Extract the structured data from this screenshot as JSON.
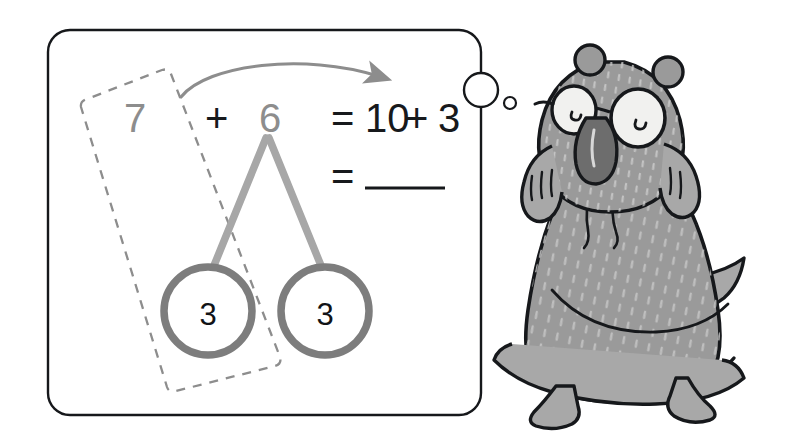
{
  "page": {
    "width": 795,
    "height": 436,
    "background": "#ffffff",
    "kind": "math-worksheet-illustration"
  },
  "panel": {
    "label": "make-ten-strategy-panel",
    "border_color": "#16181b",
    "fill": "#ffffff",
    "x": 48,
    "y": 30,
    "width": 433,
    "height": 385,
    "radius": 22
  },
  "equation": {
    "addend_left": "7",
    "plus": "+",
    "addend_right": "6",
    "equals_first": "=",
    "ten": "10",
    "plus_second": "+",
    "three": "3",
    "equals_second": "=",
    "blank_answer": "",
    "dim_color": "#8d8d8d",
    "dark_color": "#17191c"
  },
  "number_bond": {
    "label": "decomposition-of-6",
    "branch_color": "#a7a7a7",
    "circle_stroke": "#7d7d7d",
    "left_part": "3",
    "right_part": "3"
  },
  "dashed_box": {
    "label": "make-ten-grouping",
    "color": "#8d8d8d",
    "style": "dashed",
    "rotation_deg": -10
  },
  "arrow": {
    "label": "make-ten-arrow",
    "color": "#8d8d8d",
    "direction": "left-to-right-curved"
  },
  "binder_holes": {
    "large": {
      "cx": 481,
      "cy": 90,
      "r": 17,
      "stroke": "#16181b"
    },
    "small": {
      "cx": 510,
      "cy": 103,
      "r": 6,
      "stroke": "#16181b"
    }
  },
  "character": {
    "label": "bear-with-glasses",
    "description": "grey bear wearing glasses and a hoodie, mouth open",
    "outline": "#16181b",
    "body_fill": "#9a9a9a",
    "fur_light": "#b5b5b5",
    "eye_fill": "#f1f1ef",
    "mouth_fill": "#6d6d6d"
  }
}
